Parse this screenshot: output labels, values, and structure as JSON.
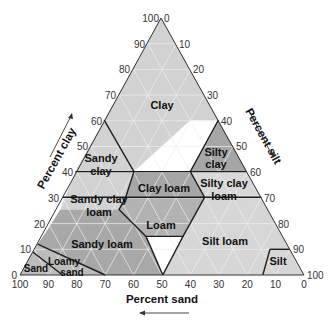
{
  "diagram": {
    "type": "soil-texture-triangle",
    "axes": {
      "clay": {
        "label": "Percent clay",
        "ticks": [
          "0",
          "10",
          "20",
          "30",
          "40",
          "50",
          "60",
          "70",
          "80",
          "90",
          "100"
        ]
      },
      "silt": {
        "label": "Percent silt",
        "ticks": [
          "0",
          "10",
          "20",
          "30",
          "40",
          "50",
          "60",
          "70",
          "80",
          "90",
          "100"
        ]
      },
      "sand": {
        "label": "Percent sand",
        "ticks": [
          "100",
          "90",
          "80",
          "70",
          "60",
          "50",
          "40",
          "30",
          "20",
          "10",
          "0"
        ]
      }
    },
    "classes": [
      {
        "name": "Clay",
        "label_lines": [
          "Clay"
        ]
      },
      {
        "name": "Sandy clay",
        "label_lines": [
          "Sandy",
          "clay"
        ]
      },
      {
        "name": "Silty clay",
        "label_lines": [
          "Silty",
          "clay"
        ]
      },
      {
        "name": "Sandy clay loam",
        "label_lines": [
          "Sandy clay",
          "loam"
        ]
      },
      {
        "name": "Clay loam",
        "label_lines": [
          "Clay loam"
        ]
      },
      {
        "name": "Silty clay loam",
        "label_lines": [
          "Silty clay",
          "loam"
        ]
      },
      {
        "name": "Loam",
        "label_lines": [
          "Loam"
        ]
      },
      {
        "name": "Sandy loam",
        "label_lines": [
          "Sandy loam"
        ]
      },
      {
        "name": "Silt loam",
        "label_lines": [
          "Silt loam"
        ]
      },
      {
        "name": "Silt",
        "label_lines": [
          "Silt"
        ]
      },
      {
        "name": "Loamy sand",
        "label_lines": [
          "Loamy",
          "sand"
        ]
      },
      {
        "name": "Sand",
        "label_lines": [
          "Sand"
        ]
      }
    ],
    "colors": {
      "light": "#d4d4d4",
      "medium": "#b8b8b8",
      "dark": "#a2a2a2",
      "grid": "#f2f2f2",
      "border": "#222222"
    }
  }
}
